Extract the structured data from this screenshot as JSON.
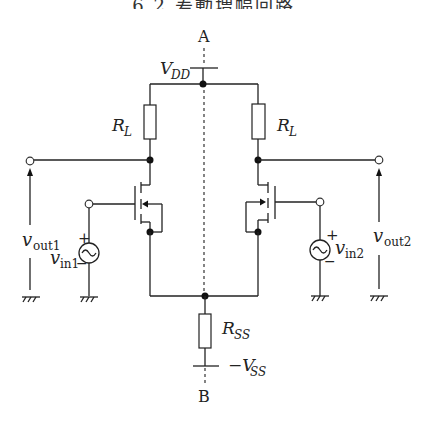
{
  "header": {
    "title": "6.2 差動増幅回路"
  },
  "diagram": {
    "type": "circuit",
    "axis": {
      "top_label": "A",
      "bottom_label": "B"
    },
    "supply": {
      "vdd": {
        "main": "V",
        "sub": "DD"
      },
      "vss": {
        "prefix": "−V",
        "sub": "SS"
      }
    },
    "resistors": {
      "load_left": {
        "main": "R",
        "sub": "L"
      },
      "load_right": {
        "main": "R",
        "sub": "L"
      },
      "tail": {
        "main": "R",
        "sub": "SS"
      }
    },
    "sources": {
      "in1": {
        "main": "v",
        "sub": "in1",
        "plus": "+",
        "minus": "−"
      },
      "in2": {
        "main": "v",
        "sub": "in2",
        "plus": "+",
        "minus": "−"
      }
    },
    "outputs": {
      "out1": {
        "main": "v",
        "sub": "out1"
      },
      "out2": {
        "main": "v",
        "sub": "out2"
      }
    }
  }
}
